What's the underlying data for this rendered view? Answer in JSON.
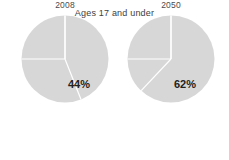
{
  "chart_data": {
    "type": "pie",
    "title": "Ages 17 and under",
    "xlabel": "",
    "ylabel": "",
    "grid": false,
    "legend": "none",
    "colors": {
      "slice_fill": "#d7d7d7",
      "divider": "#ffffff",
      "background": "#ffffff",
      "title_text": "#404040",
      "label_text": "#222222"
    },
    "charts": [
      {
        "name": "2008",
        "label": "2008",
        "highlight_value": 44,
        "highlight_label": "44%",
        "slices": [
          {
            "label": "44%",
            "value": 44,
            "start_deg": 0,
            "end_deg": 158.4
          },
          {
            "label": "",
            "value": 31,
            "start_deg": 158.4,
            "end_deg": 270.0
          },
          {
            "label": "",
            "value": 25,
            "start_deg": 270.0,
            "end_deg": 360.0
          }
        ]
      },
      {
        "name": "2050",
        "label": "2050",
        "highlight_value": 62,
        "highlight_label": "62%",
        "slices": [
          {
            "label": "62%",
            "value": 62,
            "start_deg": 0,
            "end_deg": 223.2
          },
          {
            "label": "",
            "value": 13,
            "start_deg": 223.2,
            "end_deg": 270.0
          },
          {
            "label": "",
            "value": 25,
            "start_deg": 270.0,
            "end_deg": 360.0
          }
        ]
      }
    ]
  },
  "figure": {
    "title": "Ages 17 and under",
    "pies": [
      {
        "year": "2008",
        "percent": "44%"
      },
      {
        "year": "2050",
        "percent": "62%"
      }
    ]
  }
}
